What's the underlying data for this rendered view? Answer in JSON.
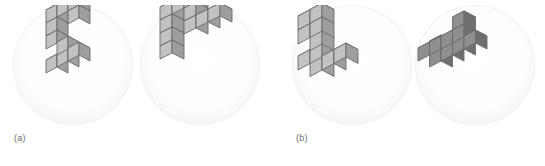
{
  "figure": {
    "background_color": "#ffffff",
    "disc_fill_color": "#f6f6f6",
    "width": 545,
    "height": 166
  },
  "captions": [
    {
      "id": "caption-a",
      "label": "(a)",
      "x": 14,
      "y": 133
    },
    {
      "id": "caption-b",
      "label": "(b)",
      "x": 296,
      "y": 133
    }
  ],
  "palette": {
    "top_face": "#d9d9d9",
    "left_face": "#c2c2c2",
    "right_face": "#9e9e9e",
    "top_face_dark": "#b4b4b4",
    "left_face_dark": "#8f8f8f",
    "right_face_dark": "#6f6f6f",
    "edge_stroke": "#6b6b6b",
    "caption_color": "#6d6d6d"
  },
  "panels": [
    {
      "id": "panel-1",
      "name": "shape-panel-a-left",
      "pair": "a",
      "role": "reference",
      "x": 13,
      "y": 5,
      "diameter": 120,
      "cube_count": 10,
      "shading": "light",
      "projection": {
        "cube": 13,
        "dx": 11,
        "dy": -6,
        "dz": 13,
        "origin_x": 44,
        "origin_y": 74
      },
      "cubes": [
        [
          0,
          0,
          0
        ],
        [
          1,
          0,
          0
        ],
        [
          2,
          0,
          0
        ],
        [
          2,
          0,
          1
        ],
        [
          2,
          0,
          2
        ],
        [
          2,
          1,
          2
        ],
        [
          2,
          2,
          2
        ],
        [
          3,
          2,
          2
        ],
        [
          4,
          2,
          2
        ],
        [
          4,
          1,
          2
        ]
      ]
    },
    {
      "id": "panel-2",
      "name": "shape-panel-a-right",
      "pair": "a",
      "role": "comparison",
      "x": 140,
      "y": 5,
      "diameter": 120,
      "cube_count": 10,
      "shading": "light",
      "projection": {
        "cube": 13,
        "dx": 12,
        "dy": -6,
        "dz": 13,
        "origin_x": 32,
        "origin_y": 60
      },
      "cubes": [
        [
          0,
          0,
          0
        ],
        [
          0,
          1,
          0
        ],
        [
          0,
          2,
          0
        ],
        [
          0,
          3,
          0
        ],
        [
          1,
          3,
          0
        ],
        [
          2,
          3,
          0
        ],
        [
          2,
          2,
          0
        ],
        [
          2,
          1,
          0
        ],
        [
          3,
          1,
          0
        ],
        [
          4,
          1,
          0
        ]
      ]
    },
    {
      "id": "panel-3",
      "name": "shape-panel-b-left",
      "pair": "b",
      "role": "reference",
      "x": 292,
      "y": 5,
      "diameter": 120,
      "cube_count": 10,
      "shading": "light",
      "projection": {
        "cube": 14,
        "dx": 12,
        "dy": -6.5,
        "dz": 14,
        "origin_x": 30,
        "origin_y": 78
      },
      "cubes": [
        [
          0,
          0,
          0
        ],
        [
          1,
          0,
          0
        ],
        [
          2,
          0,
          0
        ],
        [
          0,
          0,
          1
        ],
        [
          1,
          0,
          1
        ],
        [
          2,
          0,
          2
        ],
        [
          2,
          0,
          3
        ],
        [
          2,
          1,
          3
        ],
        [
          3,
          1,
          3
        ],
        [
          3,
          0,
          3
        ]
      ]
    },
    {
      "id": "panel-4",
      "name": "shape-panel-b-right",
      "pair": "b",
      "role": "comparison",
      "x": 415,
      "y": 5,
      "diameter": 120,
      "cube_count": 10,
      "shading": "dark",
      "projection": {
        "cube": 13,
        "dx": 11.5,
        "dy": -6,
        "dz": 13,
        "origin_x": 26,
        "origin_y": 68
      },
      "cubes": [
        [
          0,
          0,
          0
        ],
        [
          1,
          0,
          0
        ],
        [
          2,
          0,
          0
        ],
        [
          3,
          0,
          0
        ],
        [
          0,
          0,
          1
        ],
        [
          1,
          0,
          1
        ],
        [
          2,
          0,
          1
        ],
        [
          3,
          0,
          1
        ],
        [
          0,
          1,
          0
        ],
        [
          3,
          1,
          1
        ]
      ]
    }
  ]
}
